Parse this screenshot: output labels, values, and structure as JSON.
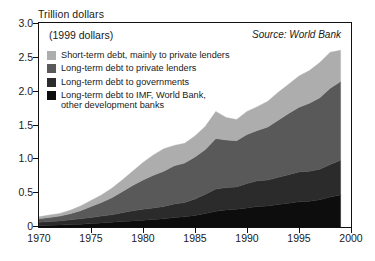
{
  "chart_data": {
    "type": "area",
    "title": "Trillion dollars",
    "subtitle": "(1999 dollars)",
    "source": "Source: World Bank",
    "xlabel": "",
    "ylabel": "Trillion dollars",
    "stacked": true,
    "grid": false,
    "legend_position": "top-left-inside",
    "xlim": [
      1970,
      2000
    ],
    "ylim": [
      0,
      3.0
    ],
    "xticks": [
      1970,
      1975,
      1980,
      1985,
      1990,
      1995,
      2000
    ],
    "yticks": [
      0,
      0.5,
      1.0,
      1.5,
      2.0,
      2.5,
      3.0
    ],
    "ytick_labels": [
      "0",
      "0.5",
      "1.0",
      "1.5",
      "2.0",
      "2.5",
      "3.0"
    ],
    "xtick_labels": [
      "1970",
      "1975",
      "1980",
      "1985",
      "1990",
      "1995",
      "2000"
    ],
    "x": [
      1970,
      1971,
      1972,
      1973,
      1974,
      1975,
      1976,
      1977,
      1978,
      1979,
      1980,
      1981,
      1982,
      1983,
      1984,
      1985,
      1986,
      1987,
      1988,
      1989,
      1990,
      1991,
      1992,
      1993,
      1994,
      1995,
      1996,
      1997,
      1998,
      1999
    ],
    "series": [
      {
        "name": "Long-term debt to IMF, World Bank, other development banks",
        "color": "#0d0d0d",
        "values": [
          0.02,
          0.025,
          0.03,
          0.035,
          0.04,
          0.05,
          0.06,
          0.07,
          0.08,
          0.09,
          0.1,
          0.11,
          0.12,
          0.14,
          0.15,
          0.17,
          0.2,
          0.23,
          0.25,
          0.26,
          0.28,
          0.3,
          0.31,
          0.33,
          0.35,
          0.37,
          0.38,
          0.4,
          0.44,
          0.47
        ]
      },
      {
        "name": "Long-term debt to governments",
        "color": "#2b2b2b",
        "values": [
          0.05,
          0.055,
          0.06,
          0.07,
          0.08,
          0.09,
          0.1,
          0.11,
          0.13,
          0.15,
          0.16,
          0.17,
          0.18,
          0.2,
          0.21,
          0.24,
          0.28,
          0.33,
          0.33,
          0.33,
          0.36,
          0.38,
          0.38,
          0.4,
          0.42,
          0.44,
          0.44,
          0.45,
          0.48,
          0.51
        ]
      },
      {
        "name": "Long-term debt to private lenders",
        "color": "#595959",
        "values": [
          0.05,
          0.06,
          0.07,
          0.09,
          0.12,
          0.16,
          0.2,
          0.25,
          0.31,
          0.37,
          0.43,
          0.48,
          0.52,
          0.56,
          0.58,
          0.62,
          0.66,
          0.74,
          0.7,
          0.68,
          0.72,
          0.74,
          0.78,
          0.84,
          0.9,
          0.95,
          1.0,
          1.05,
          1.12,
          1.16
        ]
      },
      {
        "name": "Short-term debt, mainly to private lenders",
        "color": "#adadad",
        "values": [
          0.03,
          0.035,
          0.04,
          0.05,
          0.07,
          0.09,
          0.11,
          0.14,
          0.17,
          0.21,
          0.26,
          0.3,
          0.33,
          0.3,
          0.29,
          0.31,
          0.34,
          0.4,
          0.33,
          0.31,
          0.34,
          0.35,
          0.38,
          0.41,
          0.43,
          0.46,
          0.48,
          0.52,
          0.53,
          0.46
        ]
      }
    ],
    "totals_note": "stacked total peaks near 2.6 trillion in 1998"
  },
  "legend": {
    "items": [
      {
        "label": "Short-term debt, mainly to private lenders",
        "color": "#adadad",
        "swatch_name": "legend-swatch-short-term"
      },
      {
        "label": "Long-term debt to private lenders",
        "color": "#595959",
        "swatch_name": "legend-swatch-long-term-private"
      },
      {
        "label": "Long-term debt to governments",
        "color": "#2b2b2b",
        "swatch_name": "legend-swatch-long-term-governments"
      },
      {
        "label": "Long-term debt to IMF, World Bank,\nother development banks",
        "color": "#0d0d0d",
        "swatch_name": "legend-swatch-long-term-imf"
      }
    ]
  },
  "annotations": {
    "axis_title": "Trillion dollars",
    "subtitle": "(1999 dollars)",
    "source": "Source: World Bank"
  }
}
